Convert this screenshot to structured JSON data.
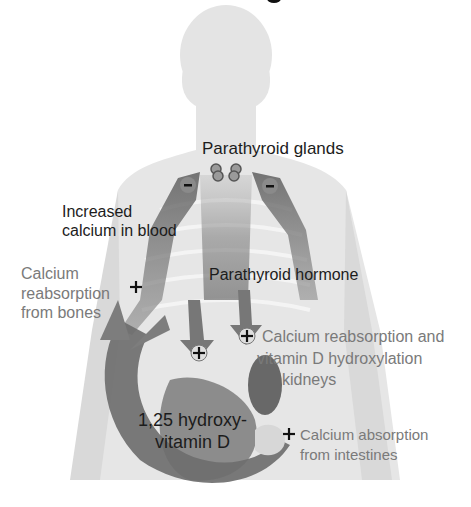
{
  "diagram": {
    "labels": {
      "parathyroid_glands": "Parathyroid glands",
      "increased_calcium": [
        "Increased",
        "calcium in blood"
      ],
      "bone_reabsorption": [
        "Calcium",
        "reabsorption",
        "from bones"
      ],
      "parathyroid_hormone": "Parathyroid hormone",
      "kidney_effect": [
        "Calcium reabsorption and",
        "vitamin D hydroxylation",
        "kidneys"
      ],
      "vitamin_d": [
        "1,25 hydroxy-",
        "vitamin D"
      ],
      "intestine_absorption": [
        "Calcium absorption",
        "from intestines"
      ]
    },
    "markers": {
      "inhibit": "-",
      "stimulate": "+"
    },
    "colors": {
      "body_silhouette": "#e3e3e3",
      "arrow": "#6e6e6e",
      "arrow_dark": "#555555",
      "dark_text": "#1c1c1c",
      "gray_text": "#7a7a7a"
    }
  }
}
